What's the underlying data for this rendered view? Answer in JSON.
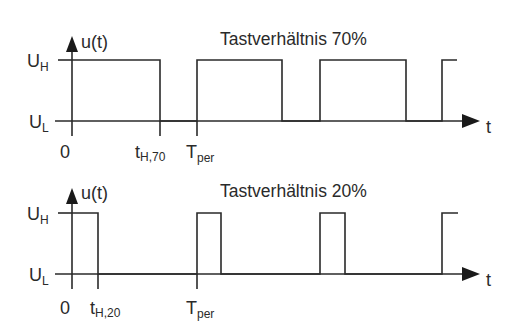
{
  "diagrams": [
    {
      "title": "Tastverhältnis 70%",
      "y_axis_label": "u(t)",
      "x_axis_label": "t",
      "level_high": {
        "base": "U",
        "sub": "H"
      },
      "level_low": {
        "base": "U",
        "sub": "L"
      },
      "origin_label": "0",
      "t_high_label": {
        "base": "t",
        "sub": "H,70"
      },
      "period_label": {
        "base": "T",
        "sub": "per"
      },
      "duty_cycle_percent": 70
    },
    {
      "title": "Tastverhältnis 20%",
      "y_axis_label": "u(t)",
      "x_axis_label": "t",
      "level_high": {
        "base": "U",
        "sub": "H"
      },
      "level_low": {
        "base": "U",
        "sub": "L"
      },
      "origin_label": "0",
      "t_high_label": {
        "base": "t",
        "sub": "H,20"
      },
      "period_label": {
        "base": "T",
        "sub": "per"
      },
      "duty_cycle_percent": 20
    }
  ],
  "colors": {
    "line": "#2a2a2a",
    "background": "#ffffff"
  }
}
